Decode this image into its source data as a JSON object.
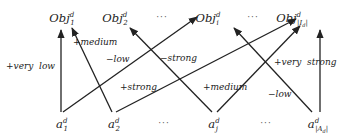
{
  "diagram": {
    "objectives": [
      {
        "id": "obj1",
        "base": "Obj",
        "sub": "1",
        "sup": "d",
        "x": 62,
        "y": 22
      },
      {
        "id": "obj2",
        "base": "Obj",
        "sub": "2",
        "sup": "d",
        "x": 115,
        "y": 22
      },
      {
        "id": "obji",
        "base": "Obj",
        "sub": "i",
        "sup": "d",
        "x": 208,
        "y": 22
      },
      {
        "id": "objI",
        "base": "Obj",
        "sub": "|I_d|",
        "sup": "d",
        "x": 292,
        "y": 22
      }
    ],
    "objective_dots": [
      {
        "text": "···",
        "x": 162,
        "y": 20
      },
      {
        "text": "···",
        "x": 253,
        "y": 20
      }
    ],
    "attributes": [
      {
        "id": "a1",
        "base": "a",
        "sub": "1",
        "sup": "d",
        "x": 62,
        "y": 128
      },
      {
        "id": "a2",
        "base": "a",
        "sub": "2",
        "sup": "d",
        "x": 114,
        "y": 128
      },
      {
        "id": "aj",
        "base": "a",
        "sub": "j",
        "sup": "d",
        "x": 214,
        "y": 128
      },
      {
        "id": "aA",
        "base": "a",
        "sub": "|A_d|",
        "sup": "d",
        "x": 318,
        "y": 128
      }
    ],
    "attribute_dots": [
      {
        "text": "···",
        "x": 164,
        "y": 126
      },
      {
        "text": "···",
        "x": 266,
        "y": 126
      }
    ],
    "edges": [
      {
        "from": "a1",
        "to": "obj1",
        "label": "+very  low",
        "x1": 61,
        "y1": 112,
        "x2": 61,
        "y2": 30,
        "lx": 6,
        "ly": 69
      },
      {
        "from": "a1",
        "to": "obji",
        "label": "−low",
        "x1": 63,
        "y1": 112,
        "x2": 197,
        "y2": 17,
        "lx": 106,
        "ly": 62
      },
      {
        "from": "a2",
        "to": "obj1",
        "label": "+medium",
        "x1": 112,
        "y1": 112,
        "x2": 72,
        "y2": 28,
        "lx": 73,
        "ly": 45
      },
      {
        "from": "a2",
        "to": "objI",
        "label": "+strong",
        "x1": 116,
        "y1": 112,
        "x2": 296,
        "y2": 19,
        "lx": 120,
        "ly": 90
      },
      {
        "from": "aj",
        "to": "obj2",
        "label": "−strong",
        "x1": 212,
        "y1": 112,
        "x2": 130,
        "y2": 28,
        "lx": 160,
        "ly": 61
      },
      {
        "from": "aj",
        "to": "objI",
        "label": "+medium",
        "x1": 217,
        "y1": 112,
        "x2": 300,
        "y2": 26,
        "lx": 203,
        "ly": 90
      },
      {
        "from": "aA",
        "to": "obji",
        "label": "−low",
        "x1": 312,
        "y1": 112,
        "x2": 234,
        "y2": 28,
        "lx": 268,
        "ly": 97
      },
      {
        "from": "aA",
        "to": "objI",
        "label": "+very  strong",
        "x1": 320,
        "y1": 112,
        "x2": 320,
        "y2": 30,
        "lx": 274,
        "ly": 65
      }
    ]
  }
}
